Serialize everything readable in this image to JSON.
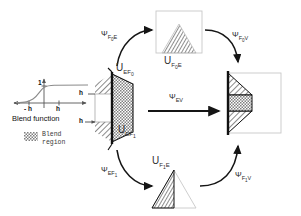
{
  "figure": {
    "type": "diagram"
  },
  "blend_plot": {
    "title": "Blend function",
    "y_tick_label": "1",
    "x_tick_left_label": "- h",
    "x_tick_right_label": "h",
    "curve": "sigmoid",
    "axis_color": "#555555",
    "curve_color": "#777777"
  },
  "legend": {
    "line1": "Blend",
    "line2": "region",
    "swatch": "checker-pattern"
  },
  "center_shape": {
    "name": "edge-solid",
    "label_top": "U",
    "label_top_sub": "EF",
    "label_top_subsub": "0",
    "label_bottom": "U",
    "label_bottom_sub": "EF",
    "label_bottom_subsub": "1",
    "h_label_upper": "h",
    "h_label_lower": "h"
  },
  "top_shape": {
    "name": "face0-triangle",
    "label": "U",
    "label_sub": "F",
    "label_subsub": "0",
    "label_sub_tail": "E"
  },
  "bottom_shape": {
    "name": "face1-triangle",
    "label": "U",
    "label_sub": "F",
    "label_subsub": "1",
    "label_sub_tail": "E"
  },
  "right_shape": {
    "name": "vertex-solid"
  },
  "arrows": {
    "top_left": {
      "psi": "Ψ",
      "sub": "F",
      "subsub": "0",
      "sub_tail": "E"
    },
    "top_right": {
      "psi": "Ψ",
      "sub": "F",
      "subsub": "0",
      "sub_tail": "V"
    },
    "center": {
      "psi": "Ψ",
      "sub": "EV",
      "subsub": "",
      "sub_tail": ""
    },
    "bottom_left": {
      "psi": "Ψ",
      "sub": "EF",
      "subsub": "1",
      "sub_tail": ""
    },
    "bottom_right": {
      "psi": "Ψ",
      "sub": "F",
      "subsub": "1",
      "sub_tail": "V"
    }
  },
  "colors": {
    "stroke": "#111111",
    "box_outline": "#c8c8c8",
    "hatch": "#3a3a3a",
    "arrow": "#151515"
  }
}
